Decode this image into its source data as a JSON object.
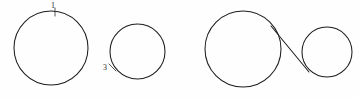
{
  "figure": {
    "background_color": "#fefefe",
    "stroke_color": "#1d1d1f",
    "label_color": "#2b2b2d",
    "width": 359,
    "height": 98
  },
  "shapes": {
    "circle_one": {
      "label": "1",
      "cx": 51,
      "cy": 48,
      "r": 37,
      "label_x": 53,
      "label_y": 6
    },
    "circle_three": {
      "label": "3",
      "cx": 137.5,
      "cy": 51.5,
      "r": 27.5,
      "label_x": 105,
      "label_y": 68
    },
    "circle_big_right": {
      "label": "",
      "cx": 243,
      "cy": 49,
      "r": 38
    },
    "circle_small_right": {
      "label": "",
      "cx": 327,
      "cy": 52,
      "r": 25
    },
    "connector_line": {
      "label": "",
      "x1": 271,
      "y1": 26,
      "x2": 309,
      "y2": 72
    }
  },
  "ticks": {
    "tick_one": {
      "x1": 55,
      "y1": 8,
      "x2": 55,
      "y2": 16
    },
    "tick_three": {
      "x1": 109,
      "y1": 64,
      "x2": 116,
      "y2": 71
    }
  }
}
